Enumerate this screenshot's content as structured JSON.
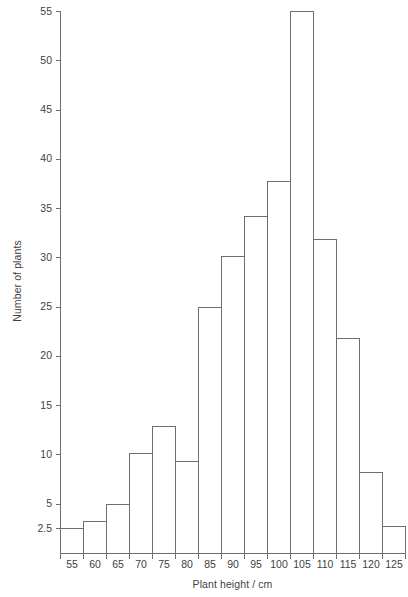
{
  "chart_data": {
    "type": "bar",
    "title": "",
    "xlabel": "Plant height / cm",
    "ylabel": "Number of plants",
    "categories": [
      "55",
      "60",
      "65",
      "70",
      "75",
      "80",
      "85",
      "90",
      "95",
      "100",
      "105",
      "110",
      "115",
      "120",
      "125"
    ],
    "values": [
      2.5,
      3.2,
      5.0,
      10.1,
      12.9,
      9.3,
      25.0,
      30.1,
      34.2,
      37.7,
      55.0,
      31.9,
      21.8,
      8.2,
      2.7
    ],
    "xtick_labels": [
      "55",
      "60",
      "65",
      "70",
      "75",
      "80",
      "85",
      "90",
      "95",
      "100",
      "105",
      "110",
      "115",
      "120",
      "125"
    ],
    "ytick_labels": [
      "2.5",
      "5",
      "10",
      "15",
      "20",
      "25",
      "30",
      "35",
      "40",
      "45",
      "50",
      "55"
    ],
    "ytick_values": [
      2.5,
      5,
      10,
      15,
      20,
      25,
      30,
      35,
      40,
      45,
      50,
      55
    ],
    "ylim": [
      0,
      55
    ],
    "xlim_index": [
      0,
      15
    ],
    "grid": false,
    "legend": null,
    "bar_fill_color": "#ffffff",
    "bar_stroke_color": "#6e6e6e",
    "axis_color": "#6e6e6e",
    "text_color": "#3f3f3f",
    "background_color": "#ffffff"
  },
  "axes": {
    "y_title": "Number of plants",
    "x_title": "Plant height / cm"
  }
}
